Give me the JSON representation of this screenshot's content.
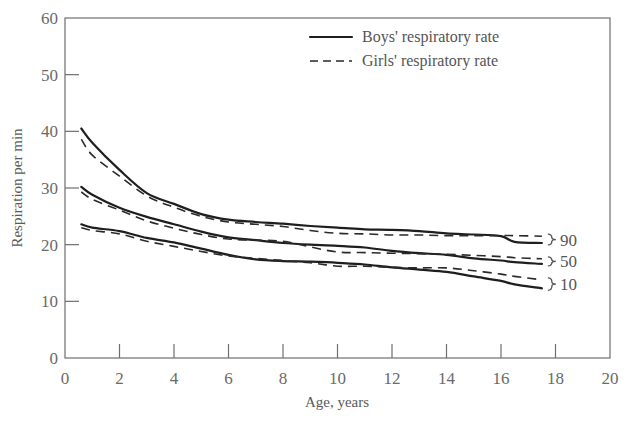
{
  "chart_data": {
    "type": "line",
    "title": "",
    "xlabel": "Age, years",
    "ylabel": "Respiration per min",
    "xlim": [
      0,
      20
    ],
    "ylim": [
      0,
      60
    ],
    "xticks": [
      0,
      2,
      4,
      6,
      8,
      10,
      12,
      14,
      16,
      18,
      20
    ],
    "yticks": [
      0,
      10,
      20,
      30,
      40,
      50,
      60
    ],
    "grid": false,
    "legend_position": "top-right",
    "legend": [
      {
        "label": "Boys' respiratory rate",
        "style": "solid"
      },
      {
        "label": "Girls' respiratory rate",
        "style": "dashed"
      }
    ],
    "percentile_labels": [
      "90",
      "50",
      "10"
    ],
    "x": [
      0.6,
      1,
      2,
      3,
      4,
      5,
      6,
      7,
      8,
      9,
      10,
      11,
      12,
      13,
      14,
      15,
      16,
      16.5,
      17.5
    ],
    "series": [
      {
        "name": "Boys 90th percentile",
        "style": "solid",
        "percentile": "90",
        "values": [
          40.5,
          38.0,
          33.2,
          29.1,
          27.2,
          25.4,
          24.4,
          24.0,
          23.7,
          23.3,
          23.0,
          22.7,
          22.6,
          22.4,
          22.0,
          21.8,
          21.5,
          20.5,
          20.3
        ]
      },
      {
        "name": "Girls 90th percentile",
        "style": "dashed",
        "percentile": "90",
        "values": [
          38.6,
          35.8,
          32.1,
          28.6,
          26.6,
          25.0,
          24.0,
          23.6,
          23.2,
          22.5,
          22.0,
          21.9,
          21.7,
          21.7,
          21.6,
          21.6,
          21.6,
          21.6,
          21.5
        ]
      },
      {
        "name": "Boys 50th percentile",
        "style": "solid",
        "percentile": "50",
        "values": [
          30.2,
          28.8,
          26.5,
          24.9,
          23.6,
          22.3,
          21.3,
          20.8,
          20.3,
          20.0,
          19.8,
          19.5,
          18.9,
          18.5,
          18.2,
          17.6,
          17.2,
          16.9,
          16.6
        ]
      },
      {
        "name": "Girls 50th percentile",
        "style": "dashed",
        "percentile": "50",
        "values": [
          29.3,
          28.0,
          26.1,
          24.2,
          22.9,
          21.8,
          21.0,
          20.8,
          20.6,
          19.6,
          18.7,
          18.6,
          18.5,
          18.4,
          18.3,
          18.1,
          17.9,
          17.7,
          17.5
        ]
      },
      {
        "name": "Boys 10th percentile",
        "style": "solid",
        "percentile": "10",
        "values": [
          23.6,
          23.0,
          22.4,
          21.2,
          20.4,
          19.3,
          18.2,
          17.4,
          17.1,
          17.0,
          16.8,
          16.5,
          16.0,
          15.6,
          15.2,
          14.4,
          13.6,
          13.0,
          12.3
        ]
      },
      {
        "name": "Girls 10th percentile",
        "style": "dashed",
        "percentile": "10",
        "values": [
          23.0,
          22.5,
          21.9,
          20.6,
          19.7,
          18.8,
          18.0,
          17.6,
          17.2,
          16.8,
          16.2,
          16.2,
          16.0,
          15.9,
          15.9,
          15.4,
          14.8,
          14.4,
          13.8
        ]
      }
    ]
  }
}
